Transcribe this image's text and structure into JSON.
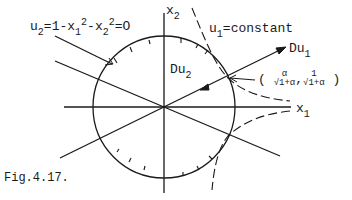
{
  "figure": {
    "caption": "Fig.4.17.",
    "labels": {
      "constraint_u2": {
        "main": "u",
        "sub": "2",
        "rest_a": "=1-x",
        "sub_a": "1",
        "sup_a": "2",
        "rest_b": "-x",
        "sub_b": "2",
        "sup_b": "2",
        "rest_c": "=O"
      },
      "level_set_u1": {
        "main": "u",
        "sub": "1",
        "rest": "=constant"
      },
      "gradient_u1": {
        "main": "Du",
        "sub": "1"
      },
      "gradient_u2": {
        "main": "Du",
        "sub": "2"
      },
      "axis_x1": {
        "main": "x",
        "sub": "1"
      },
      "axis_x2": {
        "main": "x",
        "sub": "2"
      },
      "point": {
        "open": "(",
        "x_num": "α",
        "x_den": "√1+α",
        "comma": ",",
        "y_num": "1",
        "y_den": "√1+α",
        "close": ")"
      }
    },
    "colors": {
      "ink": "#1a1a1a",
      "background": "#ffffff"
    },
    "geometry": {
      "origin": [
        164,
        107
      ],
      "circle_radius": 70
    }
  }
}
